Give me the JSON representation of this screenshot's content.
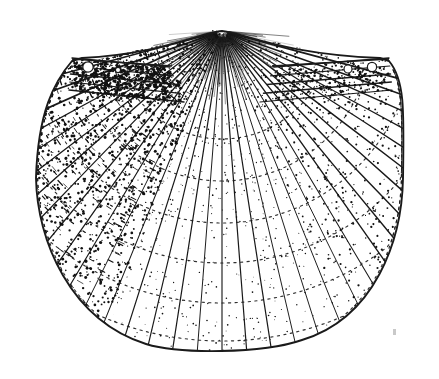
{
  "figure": {
    "kind": "scientific-line-drawing",
    "common_name": "Scallop shell (right valve, exterior view)",
    "technique": "pen-and-ink stipple engraving",
    "orientation": "umbo at top center, ventral margin at bottom",
    "background_color": "#ffffff",
    "ink_color": "#1a1a1a",
    "stipple_color": "#111111",
    "canvas": {
      "width": 439,
      "height": 379
    }
  },
  "geometry": {
    "umbo": {
      "x": 222,
      "y": 31
    },
    "hinge_line_y": 60,
    "hinge_left_x": 72,
    "hinge_right_x": 389,
    "widest_left_x": 36,
    "widest_right_x": 403,
    "widest_y": 178,
    "ventral_lowest_y": 352,
    "shell_height_px": 321,
    "shell_width_px": 367
  },
  "anatomy": {
    "parts": [
      {
        "name": "umbo",
        "label": "Umbo (beak)",
        "note": "apex at top center where all radial ribs converge"
      },
      {
        "name": "anterior-auricle",
        "label": "Anterior ear (auricle)",
        "note": "left wing along hinge, heavily stippled, bears two small circular tubercles"
      },
      {
        "name": "posterior-auricle",
        "label": "Posterior ear (auricle)",
        "note": "right wing along hinge, lightly stippled, bears two small circular tubercles"
      },
      {
        "name": "radial-ribs",
        "label": "Radial ribs (costae)",
        "note": "fan out from umbo to ventral margin"
      },
      {
        "name": "growth-lines",
        "label": "Concentric growth lines",
        "note": "dotted arcs crossing the ribs"
      },
      {
        "name": "ventral-margin",
        "label": "Ventral margin",
        "note": "scalloped / crenulate edge where ribs terminate"
      }
    ]
  },
  "render": {
    "rib_count": 44,
    "rib_angle_start_deg": -97,
    "rib_angle_end_deg": 97,
    "growth_arc_radii": [
      108,
      150,
      192,
      232,
      272,
      310
    ],
    "tubercles": [
      {
        "cx": 88,
        "cy": 67,
        "r": 5.2
      },
      {
        "cx": 118,
        "cy": 70,
        "r": 2.6
      },
      {
        "cx": 348,
        "cy": 69,
        "r": 4.0
      },
      {
        "cx": 372,
        "cy": 67,
        "r": 4.6
      }
    ],
    "stipple_seed": 20240517,
    "stipple_count_left": 2600,
    "stipple_count_right": 1150,
    "stipple_count_center": 420,
    "speck_artifact": {
      "x": 393,
      "y": 329,
      "w": 3,
      "h": 6
    }
  },
  "labels": {
    "alt_text": "Black and white stippled line drawing of a fan-shaped scallop shell with numerous radial ribs radiating from a pointed umbo at top center, flanked by two ears along the straight hinge line, and a wavy scalloped lower margin."
  }
}
